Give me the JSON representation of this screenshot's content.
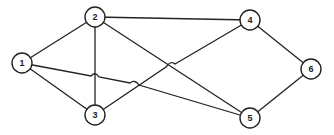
{
  "graph": {
    "nodes": [
      {
        "id": "1",
        "label": "1",
        "x": 22,
        "y": 63
      },
      {
        "id": "2",
        "label": "2",
        "x": 95,
        "y": 17
      },
      {
        "id": "3",
        "label": "3",
        "x": 95,
        "y": 115
      },
      {
        "id": "4",
        "label": "4",
        "x": 250,
        "y": 20
      },
      {
        "id": "5",
        "label": "5",
        "x": 250,
        "y": 118
      },
      {
        "id": "6",
        "label": "6",
        "x": 311,
        "y": 69
      }
    ],
    "edges": [
      {
        "from": "1",
        "to": "2"
      },
      {
        "from": "1",
        "to": "3"
      },
      {
        "from": "1",
        "to": "5",
        "hops_over": [
          "2-3",
          "3-4"
        ]
      },
      {
        "from": "2",
        "to": "3"
      },
      {
        "from": "2",
        "to": "4"
      },
      {
        "from": "2",
        "to": "5"
      },
      {
        "from": "3",
        "to": "4",
        "hops_over": [
          "2-5"
        ]
      },
      {
        "from": "4",
        "to": "6"
      },
      {
        "from": "5",
        "to": "6"
      }
    ]
  }
}
